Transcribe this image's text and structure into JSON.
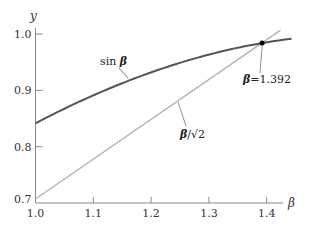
{
  "chart_data": {
    "type": "line",
    "title": "",
    "xlabel": "β",
    "ylabel": "y",
    "xlim": [
      1.0,
      1.44
    ],
    "ylim": [
      0.7,
      1.0
    ],
    "grid": false,
    "xticks": [
      "1.0",
      "1.1",
      "1.2",
      "1.3",
      "1.4"
    ],
    "yticks": [
      "0.7",
      "0.8",
      "0.9",
      "1.0"
    ],
    "series": [
      {
        "name": "sin β",
        "label_func": "sin",
        "label_var": "β",
        "color": "#555555",
        "x": [
          1.0,
          1.05,
          1.1,
          1.15,
          1.2,
          1.25,
          1.3,
          1.35,
          1.392,
          1.443
        ],
        "values": [
          0.841,
          0.867,
          0.891,
          0.913,
          0.932,
          0.949,
          0.964,
          0.976,
          0.984,
          0.992
        ]
      },
      {
        "name": "β/√2",
        "label_var": "β",
        "label_rest": "/√2",
        "color": "#b0b0b0",
        "x": [
          1.0,
          1.424
        ],
        "values": [
          0.707,
          1.007
        ]
      }
    ],
    "annotations": [
      {
        "text_var": "β",
        "text_rest": "=1.392",
        "x": 1.392,
        "y": 0.984,
        "marker": "dot"
      }
    ]
  }
}
